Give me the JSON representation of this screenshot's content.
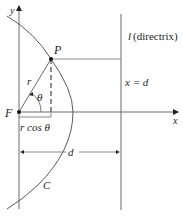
{
  "diagram": {
    "colors": {
      "stroke": "#5a5a5a",
      "text": "#231f20",
      "point": "#111111"
    },
    "labels": {
      "y_axis": "y",
      "x_axis": "x",
      "point_p": "P",
      "focus": "F",
      "radius": "r",
      "angle": "θ",
      "projection": "r cos θ",
      "directrix_name": "l",
      "directrix_desc": "(directrix)",
      "directrix_eq": "x = d",
      "distance": "d",
      "curve": "C"
    }
  }
}
